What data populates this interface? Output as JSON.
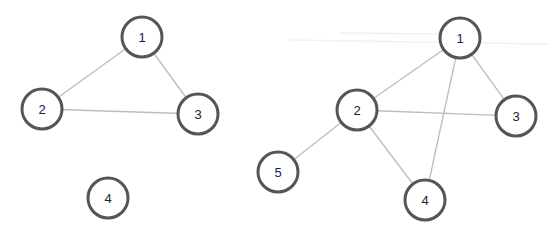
{
  "diagram": {
    "type": "graph-comparison",
    "node_radius": 20,
    "colors": {
      "node_stroke": "#555555",
      "node_fill": "#ffffff",
      "edge": "#bdbdbd",
      "label": "#222222",
      "background": "#ffffff"
    },
    "graphs": [
      {
        "id": "left",
        "nodes": [
          {
            "id": "1",
            "label": "1",
            "x": 142,
            "y": 37
          },
          {
            "id": "2",
            "label": "2",
            "x": 42,
            "y": 109
          },
          {
            "id": "3",
            "label": "3",
            "x": 198,
            "y": 114
          },
          {
            "id": "4",
            "label": "4",
            "x": 108,
            "y": 198
          }
        ],
        "edges": [
          {
            "from": "1",
            "to": "2"
          },
          {
            "from": "1",
            "to": "3"
          },
          {
            "from": "2",
            "to": "3"
          }
        ]
      },
      {
        "id": "right",
        "nodes": [
          {
            "id": "1",
            "label": "1",
            "x": 460,
            "y": 38
          },
          {
            "id": "2",
            "label": "2",
            "x": 357,
            "y": 110
          },
          {
            "id": "3",
            "label": "3",
            "x": 516,
            "y": 116
          },
          {
            "id": "4",
            "label": "4",
            "x": 425,
            "y": 200
          },
          {
            "id": "5",
            "label": "5",
            "x": 278,
            "y": 172
          }
        ],
        "edges": [
          {
            "from": "1",
            "to": "2"
          },
          {
            "from": "1",
            "to": "3"
          },
          {
            "from": "1",
            "to": "4"
          },
          {
            "from": "2",
            "to": "3"
          },
          {
            "from": "2",
            "to": "4"
          },
          {
            "from": "2",
            "to": "5"
          }
        ]
      }
    ]
  }
}
